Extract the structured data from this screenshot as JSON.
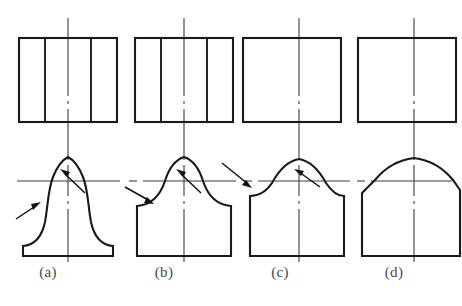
{
  "figure": {
    "kind": "engineering-drawing",
    "background_color": "#ffffff",
    "line_color": "#1a1a1a",
    "thin_line_color": "#3d3d3d",
    "caption_color": "#4a4a4a",
    "canvas": {
      "width": 462,
      "height": 306
    }
  },
  "reference_line": {
    "name": "horizontal-projection-reference-line",
    "y": 181,
    "x_start": 17,
    "x_end": 452,
    "style": "thin-solid-with-dashdot-breaks"
  },
  "variants": [
    {
      "key": "a",
      "caption": "(a)",
      "caption_x": 48,
      "caption_y": 272,
      "center_x": 68,
      "top_view": {
        "name": "top-view-rectangle-a",
        "x": 19,
        "y": 38,
        "width": 98,
        "height": 84,
        "internal_vertical_lines": 2,
        "internal_line_x": [
          45,
          91
        ]
      },
      "front_view": {
        "name": "front-view-profile-a",
        "shape": "bell-flared-base",
        "base_y": 256,
        "base_x_left": 23,
        "base_x_right": 113,
        "dome_apex_y": 157,
        "dome_radius": 24,
        "side_style": "concave-flare"
      },
      "leaders": [
        {
          "name": "leader-inner-tangent-a",
          "from": [
            85,
            193
          ],
          "to": [
            62,
            171
          ],
          "points_to": "dome-tangent-point"
        },
        {
          "name": "leader-outer-flare-a",
          "from": [
            16,
            219
          ],
          "to": [
            39,
            204
          ],
          "points_to": "concave-flare-transition"
        }
      ]
    },
    {
      "key": "b",
      "caption": "(b)",
      "caption_x": 164,
      "caption_y": 272,
      "center_x": 184,
      "top_view": {
        "name": "top-view-rectangle-b",
        "x": 135,
        "y": 38,
        "width": 98,
        "height": 84,
        "internal_vertical_lines": 2,
        "internal_line_x": [
          161,
          207
        ]
      },
      "front_view": {
        "name": "front-view-profile-b",
        "shape": "dome-with-straight-sided-base",
        "base_y": 256,
        "base_x_left": 137,
        "base_x_right": 231,
        "dome_apex_y": 157,
        "dome_radius": 24,
        "side_style": "concave-shoulder-then-vertical"
      },
      "leaders": [
        {
          "name": "leader-inner-tangent-b",
          "from": [
            201,
            193
          ],
          "to": [
            178,
            171
          ],
          "points_to": "dome-tangent-point"
        },
        {
          "name": "leader-outer-shoulder-b",
          "from": [
            125,
            187
          ],
          "to": [
            152,
            203
          ],
          "points_to": "shoulder-transition"
        }
      ]
    },
    {
      "key": "c",
      "caption": "(c)",
      "caption_x": 280,
      "caption_y": 272,
      "center_x": 299,
      "top_view": {
        "name": "top-view-rectangle-c",
        "x": 243,
        "y": 38,
        "width": 98,
        "height": 84,
        "internal_vertical_lines": 0,
        "internal_line_x": []
      },
      "front_view": {
        "name": "front-view-profile-c",
        "shape": "flat-dome-with-shoulders",
        "base_y": 256,
        "base_x_left": 250,
        "base_x_right": 344,
        "dome_apex_y": 159,
        "dome_radius": 30,
        "side_style": "shoulder-curve-then-angled"
      },
      "leaders": [
        {
          "name": "leader-inner-tangent-c",
          "from": [
            320,
            187
          ],
          "to": [
            296,
            170
          ],
          "points_to": "dome-tangent-point"
        },
        {
          "name": "leader-outer-shoulder-c",
          "from": [
            222,
            163
          ],
          "to": [
            253,
            186
          ],
          "points_to": "shoulder-transition"
        }
      ]
    },
    {
      "key": "d",
      "caption": "(d)",
      "caption_x": 394,
      "caption_y": 272,
      "center_x": 414,
      "top_view": {
        "name": "top-view-rectangle-d",
        "x": 358,
        "y": 38,
        "width": 98,
        "height": 84,
        "internal_vertical_lines": 0,
        "internal_line_x": []
      },
      "front_view": {
        "name": "front-view-profile-d",
        "shape": "pointed-arch-no-shoulder",
        "base_y": 256,
        "base_x_left": 362,
        "base_x_right": 460,
        "dome_apex_y": 158,
        "side_style": "smooth-arch-then-angled"
      },
      "leaders": []
    }
  ]
}
